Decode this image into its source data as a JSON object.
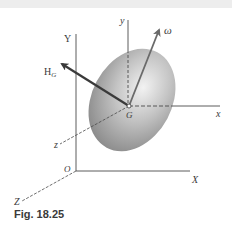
{
  "figure": {
    "caption": "Fig. 18.25",
    "labels": {
      "Y": "Y",
      "X": "X",
      "Z": "Z",
      "O": "O",
      "y": "y",
      "x": "x",
      "z": "z",
      "G": "G",
      "omega": "ω",
      "H": "H",
      "H_sub": "G"
    },
    "elements": [
      "inertial axes X, Y, Z with origin O",
      "body-fixed axes x, y, z through mass center G",
      "ellipsoidal rigid body",
      "angular velocity vector ω",
      "angular momentum vector H_G"
    ],
    "colors": {
      "axis": "#4a4a4a",
      "vector": "#3a3a3a",
      "body_light": "#e6e6e6",
      "body_dark": "#8f8f8f",
      "top_band": "#ededed"
    }
  }
}
